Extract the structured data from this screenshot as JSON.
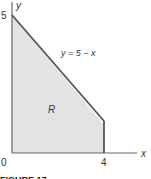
{
  "figure": {
    "caption": "FIGURE 17",
    "region_label": "R",
    "curve_label": "y = 5 − x",
    "axes": {
      "x_label": "x",
      "y_label": "y",
      "origin_label": "0",
      "x_tick": "4",
      "y_tick": "5"
    },
    "region_vertices": [
      [
        0,
        0
      ],
      [
        0,
        5
      ],
      [
        4,
        1
      ],
      [
        4,
        0
      ]
    ],
    "colors": {
      "fill": "#e3e3e3",
      "boundary": "#555555",
      "axis": "#666666"
    }
  }
}
